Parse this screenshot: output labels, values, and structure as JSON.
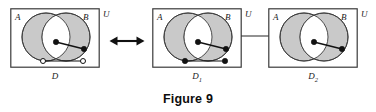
{
  "figure": {
    "caption": "Figure 9",
    "background_color": "#ffffff",
    "stroke_color": "#3a3a3a",
    "region_fill_color": "#c9c9c9",
    "lens_fill_color": "#ffffff",
    "node_fill_color": "#111111",
    "node_hollow_fill_color": "#ffffff"
  },
  "panels": [
    {
      "id": "panel-d",
      "universe_label": "U",
      "left_set_label": "A",
      "right_set_label": "B",
      "diagram_label": "D",
      "diagram_label_sub": "",
      "edges": [
        {
          "name": "upper-edge",
          "from": {
            "x": 46,
            "y": 34,
            "filled": true,
            "region": "intersection"
          },
          "to": {
            "x": 74,
            "y": 41,
            "filled": true,
            "region": "B-only"
          }
        },
        {
          "name": "lower-edge",
          "from": {
            "x": 33,
            "y": 53,
            "filled": false,
            "region": "A-only"
          },
          "to": {
            "x": 73,
            "y": 53,
            "filled": false,
            "region": "B-only"
          }
        }
      ]
    },
    {
      "id": "panel-d1",
      "universe_label": "U",
      "left_set_label": "A",
      "right_set_label": "B",
      "diagram_label": "D",
      "diagram_label_sub": "1",
      "edges": [
        {
          "name": "upper-edge",
          "from": {
            "x": 46,
            "y": 34,
            "filled": true,
            "region": "intersection"
          },
          "to": {
            "x": 74,
            "y": 41,
            "filled": true,
            "region": "B-only"
          }
        },
        {
          "name": "lower-edge",
          "from": {
            "x": 33,
            "y": 53,
            "filled": true,
            "region": "A-only"
          },
          "to": {
            "x": 73,
            "y": 53,
            "filled": true,
            "region": "B-only"
          }
        }
      ]
    },
    {
      "id": "panel-d2",
      "universe_label": "U",
      "left_set_label": "A",
      "right_set_label": "B",
      "diagram_label": "D",
      "diagram_label_sub": "2",
      "edges": [
        {
          "name": "upper-edge",
          "from": {
            "x": 46,
            "y": 34,
            "filled": true,
            "region": "intersection"
          },
          "to": {
            "x": 74,
            "y": 41,
            "filled": true,
            "region": "B-only"
          }
        }
      ]
    }
  ],
  "connectors": [
    {
      "name": "equivalence-arrow",
      "type": "double-headed-arrow",
      "between": [
        "panel-d",
        "panel-d1"
      ]
    },
    {
      "name": "decomposition-link",
      "type": "plain-line",
      "between": [
        "panel-d1",
        "panel-d2"
      ]
    }
  ]
}
